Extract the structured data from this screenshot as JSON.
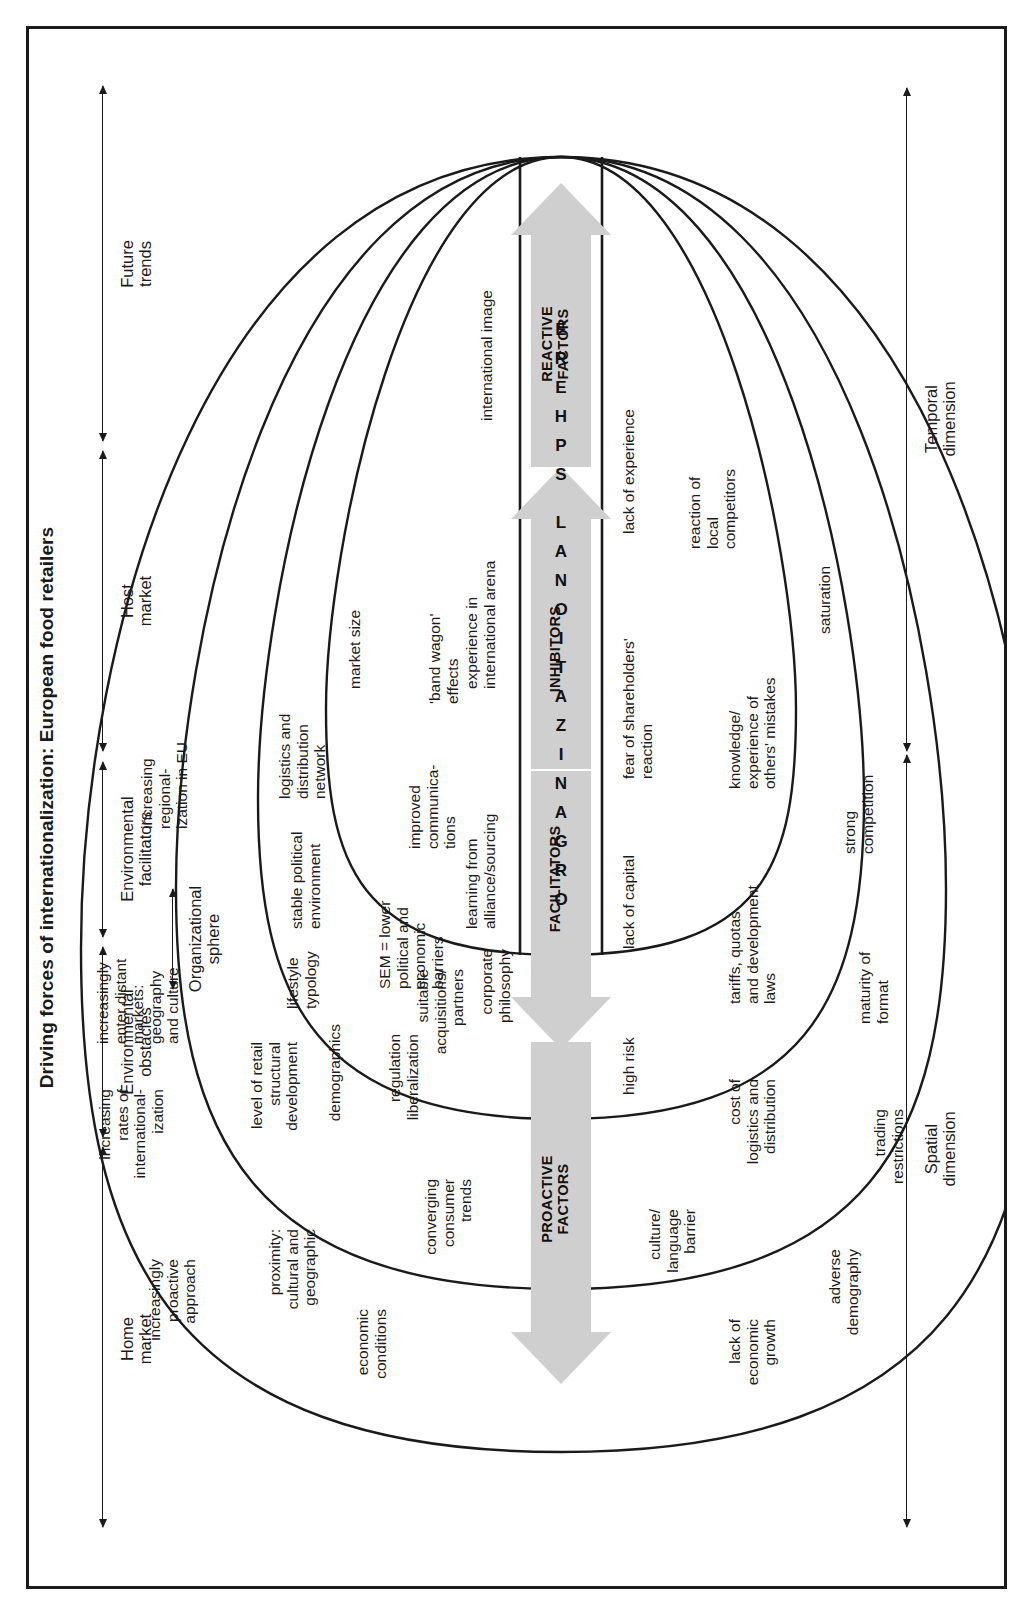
{
  "figure": {
    "title": "Driving forces of internationalization: European food retailers"
  },
  "dimension_axes": [
    {
      "id": "temporal",
      "label": "Temporal\ndimension"
    },
    {
      "id": "spatial",
      "label": "Spatial\ndimension"
    }
  ],
  "band_labels": [
    {
      "id": "future-trends",
      "label": "Future\ntrends"
    },
    {
      "id": "host-market",
      "label": "Host\nmarket"
    },
    {
      "id": "environmental-facilitators",
      "label": "Environmental\nfacilitators"
    },
    {
      "id": "organizational-sphere",
      "label": "Organizational\nsphere"
    },
    {
      "id": "environmental-obstacles",
      "label": "Environmental\nobstacles"
    },
    {
      "id": "home-market",
      "label": "Home\nmarket"
    }
  ],
  "org_sphere": {
    "letters": [
      "O",
      "R",
      "G",
      "A",
      "N",
      "I",
      "Z",
      "A",
      "T",
      "I",
      "O",
      "N",
      "A",
      "L",
      "S",
      "P",
      "H",
      "E",
      "R",
      "E"
    ],
    "text": "ORGANIZATIONAL SPHERE"
  },
  "arrows": [
    {
      "id": "proactive-factors",
      "label": "PROACTIVE\nFACTORS",
      "color": "#cfcfcf",
      "direction": "up"
    },
    {
      "id": "facilitators",
      "label": "FACILITATORS",
      "color": "#cfcfcf",
      "direction": "up"
    },
    {
      "id": "inhibitors",
      "label": "INHIBITORS",
      "color": "#cfcfcf",
      "direction": "down"
    },
    {
      "id": "reactive-factors",
      "label": "REACTIVE\nFACTORS",
      "color": "#cfcfcf",
      "direction": "down"
    }
  ],
  "zones": {
    "future_trends": {
      "name": "Future trends",
      "items_left": [
        "increasingly\nproactive\napproach",
        "increasing\nrates of\ninternational-\nization"
      ],
      "items_right": [
        "increasingly\nenter distant\nmarkets:\ngeography\nand culture",
        "increasing\nregional-\nization in EU"
      ]
    },
    "host_market": {
      "name": "Host market",
      "items_left": [
        "economic\nconditions",
        "proximity:\ncultural and\ngeographic",
        "level of retail\nstructural\ndevelopment",
        "demographics"
      ],
      "items_right": [
        "lifestyle\ntypology",
        "stable political\nenvironment",
        "logistics and\ndistribution\nnetwork",
        "market size"
      ]
    },
    "environmental_facilitators": {
      "name": "Environmental facilitators",
      "items_left": [
        "converging\nconsumer\ntrends",
        "regulation\nliberalization",
        "suitable\nacquisitions/\npartners"
      ],
      "items_right": [
        "SEM = lower\npolitical and\neconomic\nbarriers",
        "improved\ncommunica-\ntions",
        "'band wagon'\neffects"
      ]
    },
    "organizational_facilitators": {
      "name": "Organizational facilitators",
      "items_left": [
        "corporate\nphilosophy",
        "learning from\nalliance/sourcing",
        "experience in\ninternational arena"
      ],
      "items_right": [
        "international image",
        "perceived opportunities\nin SEM",
        "SEM focused\nattention and\nresearch",
        "pre-empt\nrivals"
      ]
    },
    "organizational_obstacles": {
      "name": "Organizational obstacles",
      "items_left": [
        "high risk",
        "lack of capital",
        "fear of shareholders'\nreaction",
        "lack of experience"
      ],
      "items_right": [
        "previous mistakes",
        "diversify sector",
        "lack of senior\nmanagement\nempathy"
      ]
    },
    "environmental_obstacles": {
      "name": "Environmental obstacles",
      "items_left": [
        "culture/\nlanguage\nbarrier",
        "cost of\nlogistics and\ndistribution"
      ],
      "items_right": [
        "tariffs, quotas\nand development\nlaws",
        "knowledge/\nexperience of\nothers' mistakes",
        "reaction of\nlocal\ncompetitors"
      ]
    },
    "home_market": {
      "name": "Home market",
      "items_left": [
        "lack of\neconomic\ngrowth",
        "adverse\ndemography",
        "trading\nrestrictions"
      ],
      "items_right": [
        "maturity of\nformat",
        "strong\ncompetition",
        "saturation"
      ]
    }
  }
}
